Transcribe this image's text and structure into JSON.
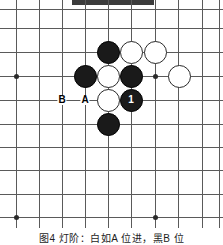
{
  "header": {
    "bar_label": ""
  },
  "caption": {
    "text": "图4 灯阶：白如A 位进，黑B 位"
  },
  "board": {
    "colors": {
      "line": "#5a5a5a",
      "black_stone": "#1a1a1a",
      "white_stone": "#ffffff",
      "white_stone_border": "#2a2a2a",
      "hoshi": "#2b2b2b",
      "background": "#ffffff"
    },
    "grid": {
      "spacing": 23.4,
      "origin_x": 16,
      "origin_y": 9,
      "cols": 9,
      "rows": 10
    },
    "vlines_x": [
      16,
      39,
      62,
      85,
      108,
      131,
      155,
      178,
      202,
      219
    ],
    "hlines_y": [
      9,
      28,
      52,
      76,
      100,
      124,
      147,
      170,
      194,
      217
    ],
    "hoshi_points": [
      {
        "x": 16,
        "y": 76
      },
      {
        "x": 155,
        "y": 76
      },
      {
        "x": 16,
        "y": 217
      },
      {
        "x": 155,
        "y": 217
      }
    ],
    "stones": [
      {
        "color": "black",
        "x": 108,
        "y": 52,
        "label": ""
      },
      {
        "color": "white",
        "x": 131,
        "y": 52,
        "label": ""
      },
      {
        "color": "white",
        "x": 155,
        "y": 52,
        "label": ""
      },
      {
        "color": "black",
        "x": 85,
        "y": 76,
        "label": ""
      },
      {
        "color": "white",
        "x": 108,
        "y": 76,
        "label": ""
      },
      {
        "color": "black",
        "x": 131,
        "y": 76,
        "label": ""
      },
      {
        "color": "white",
        "x": 179,
        "y": 76,
        "label": ""
      },
      {
        "color": "white",
        "x": 108,
        "y": 100,
        "label": ""
      },
      {
        "color": "black",
        "x": 131,
        "y": 100,
        "label": "1"
      },
      {
        "color": "black",
        "x": 108,
        "y": 124,
        "label": ""
      }
    ],
    "point_labels": [
      {
        "text": "B",
        "x": 62,
        "y": 100
      },
      {
        "text": "A",
        "x": 85,
        "y": 100
      }
    ]
  }
}
